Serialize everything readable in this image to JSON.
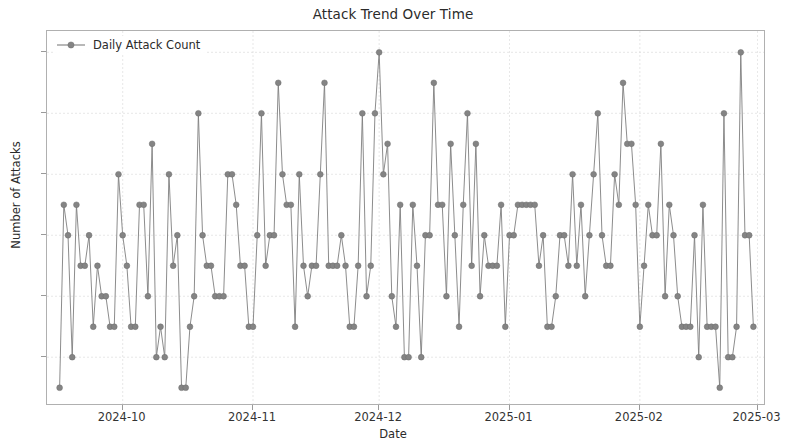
{
  "chart_data": {
    "type": "line",
    "title": "Attack Trend Over Time",
    "xlabel": "Date",
    "ylabel": "Number of Attacks",
    "grid": true,
    "legend_position": "upper left",
    "marker": "circle",
    "line_color": "#7f7f7f",
    "marker_color": "#848484",
    "xtick_labels": [
      "2024-10",
      "2024-11",
      "2024-12",
      "2025-01",
      "2025-02",
      "2025-03"
    ],
    "ytick_labels": [
      "2",
      "4",
      "6",
      "8",
      "10",
      "12"
    ],
    "yticks": [
      2,
      4,
      6,
      8,
      10,
      12
    ],
    "ylim": [
      0.4,
      12.7
    ],
    "xlim": [
      "2024-09-13",
      "2025-03-19"
    ],
    "series": [
      {
        "name": "Daily Attack Count",
        "x_start": "2024-09-16",
        "x_end": "2025-03-16",
        "x_step_days": 1,
        "values": [
          1,
          7,
          6,
          2,
          7,
          5,
          5,
          6,
          3,
          5,
          4,
          4,
          3,
          3,
          8,
          6,
          5,
          3,
          3,
          7,
          7,
          4,
          9,
          2,
          3,
          2,
          8,
          5,
          6,
          1,
          1,
          3,
          4,
          10,
          6,
          5,
          5,
          4,
          4,
          4,
          8,
          8,
          7,
          5,
          5,
          3,
          3,
          6,
          10,
          5,
          6,
          6,
          11,
          8,
          7,
          7,
          3,
          8,
          5,
          4,
          5,
          5,
          8,
          11,
          5,
          5,
          5,
          6,
          5,
          3,
          3,
          5,
          10,
          4,
          5,
          10,
          12,
          8,
          9,
          4,
          3,
          7,
          2,
          2,
          7,
          5,
          2,
          6,
          6,
          11,
          7,
          7,
          4,
          9,
          6,
          3,
          7,
          10,
          5,
          9,
          4,
          6,
          5,
          5,
          5,
          7,
          3,
          6,
          6,
          7,
          7,
          7,
          7,
          7,
          5,
          6,
          3,
          3,
          4,
          6,
          6,
          5,
          8,
          5,
          7,
          4,
          6,
          8,
          10,
          6,
          5,
          5,
          8,
          7,
          11,
          9,
          9,
          7,
          3,
          5,
          7,
          6,
          6,
          9,
          4,
          7,
          6,
          4,
          3,
          3,
          3,
          6,
          2,
          7,
          3,
          3,
          3,
          1,
          10,
          2,
          2,
          3,
          12,
          6,
          6,
          3
        ]
      }
    ]
  }
}
